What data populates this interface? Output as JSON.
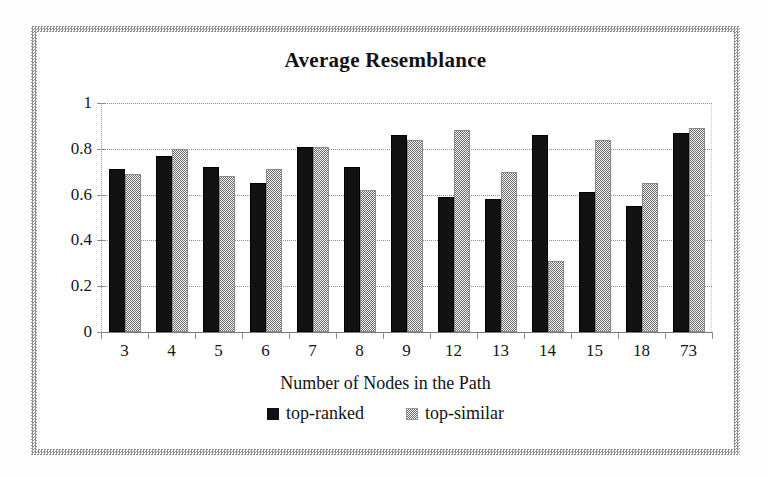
{
  "figure": {
    "title": "Average Resemblance",
    "frame_color": "#8f8f8f",
    "background": "#ffffff"
  },
  "chart_data": {
    "type": "bar",
    "title": "Average Resemblance",
    "xlabel": "Number of Nodes in the Path",
    "ylabel": "",
    "categories": [
      "3",
      "4",
      "5",
      "6",
      "7",
      "8",
      "9",
      "12",
      "13",
      "14",
      "15",
      "18",
      "73"
    ],
    "series": [
      {
        "name": "top-ranked",
        "color": "#111111",
        "values": [
          0.71,
          0.77,
          0.72,
          0.65,
          0.81,
          0.72,
          0.86,
          0.59,
          0.58,
          0.86,
          0.61,
          0.55,
          0.87
        ]
      },
      {
        "name": "top-similar",
        "color": "#6e6e6e",
        "values": [
          0.69,
          0.8,
          0.68,
          0.71,
          0.81,
          0.62,
          0.84,
          0.88,
          0.7,
          0.31,
          0.84,
          0.65,
          0.89
        ]
      }
    ],
    "ylim": [
      0,
      1
    ],
    "yticks": [
      0,
      0.2,
      0.4,
      0.6,
      0.8,
      1
    ],
    "ytick_labels": [
      "0",
      "0.2",
      "0.4",
      "0.6",
      "0.8",
      "1"
    ],
    "grid": true,
    "legend_position": "bottom"
  },
  "legend": {
    "items": [
      {
        "label": "top-ranked",
        "style": "solid-black"
      },
      {
        "label": "top-similar",
        "style": "dithered-gray"
      }
    ]
  }
}
